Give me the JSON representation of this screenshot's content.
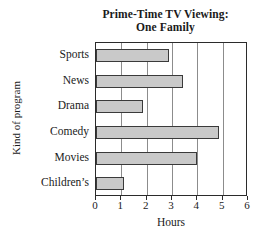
{
  "chart_data": {
    "type": "bar",
    "orientation": "horizontal",
    "title": "Prime-Time TV Viewing: One Family",
    "title_lines": [
      "Prime-Time TV Viewing:",
      "One Family"
    ],
    "categories": [
      "Sports",
      "News",
      "Drama",
      "Comedy",
      "Movies",
      "Children’s"
    ],
    "values": [
      2.9,
      3.45,
      1.85,
      4.85,
      4.0,
      1.1
    ],
    "xlabel": "Hours",
    "ylabel": "Kind of program",
    "xlim": [
      0,
      6
    ],
    "xticks": [
      0,
      1,
      2,
      3,
      4,
      5,
      6
    ],
    "xtick_labels": [
      "0",
      "1",
      "2",
      "3",
      "4",
      "5",
      "6"
    ],
    "grid": "vertical",
    "legend": "none",
    "bar_fill_color": "#c9c9c9",
    "bar_edge_color": "#3a3a3a",
    "frame_color": "#2b2b2b",
    "gridline_color": "#8c8c8c",
    "background_color": "#ffffff"
  }
}
